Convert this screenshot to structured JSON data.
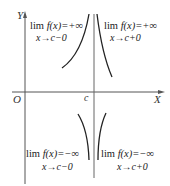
{
  "diagram": {
    "axes": {
      "y_label": "Y",
      "x_label": "X",
      "origin_label": "O",
      "c_label": "c"
    },
    "annotations": [
      {
        "position": "top-left",
        "lim": "lim",
        "expr": "f(x)=+∞",
        "subscript": "x→c−0"
      },
      {
        "position": "top-right",
        "lim": "lim",
        "expr": "f(x)=+∞",
        "subscript": "x→c+0"
      },
      {
        "position": "bottom-left",
        "lim": "lim",
        "expr": "f(x)=−∞",
        "subscript": "x→c−0"
      },
      {
        "position": "bottom-right",
        "lim": "lim",
        "expr": "f(x)=−∞",
        "subscript": "x→c+0"
      }
    ],
    "colors": {
      "axis": "#555555",
      "curve": "#222222"
    }
  }
}
